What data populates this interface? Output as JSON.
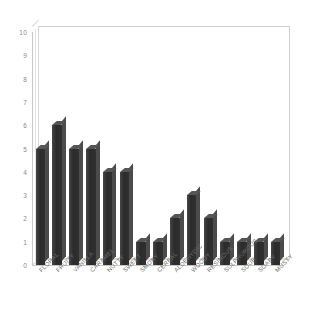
{
  "chart_data": {
    "type": "bar",
    "title": "",
    "subtitle": "",
    "xlabel": "",
    "ylabel": "",
    "ylim": [
      0,
      10
    ],
    "grid": false,
    "legend": "none",
    "style": "3d-column",
    "yticks": [
      0,
      1,
      2,
      3,
      4,
      5,
      6,
      7,
      8,
      9,
      10
    ],
    "ytick_labels": [
      "0",
      "1",
      "2",
      "3",
      "4",
      "5",
      "6",
      "7",
      "8",
      "9",
      "10"
    ],
    "categories": [
      "FLORAL",
      "FRUITY",
      "VANILLA",
      "CARAMEL",
      "NUTTY",
      "SWEET",
      "SMOKY",
      "CEREAL",
      "ALDEHYDIC",
      "WOODY",
      "RESINOUS",
      "SULPHUROUS",
      "SOUR",
      "SOAPY",
      "MUSTY"
    ],
    "values": [
      5,
      6,
      5,
      5,
      4,
      4,
      1,
      1,
      2,
      3,
      2,
      1,
      1,
      1,
      1
    ],
    "series": [
      {
        "name": "",
        "values": [
          5,
          6,
          5,
          5,
          4,
          4,
          1,
          1,
          2,
          3,
          2,
          1,
          1,
          1,
          1
        ]
      }
    ],
    "colors": {
      "bar_face": "#3a3a3a",
      "bar_top": "#555555",
      "bar_side": "#4b4b4b",
      "axis": "#c9c9c9",
      "tick_text": "#8a8a8a",
      "label_text": "#6e6e6e",
      "background": "#ffffff"
    }
  }
}
